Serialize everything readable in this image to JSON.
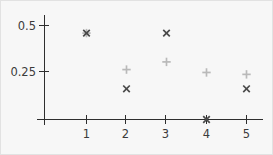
{
  "chart_data": {
    "type": "scatter",
    "title": "",
    "xlabel": "",
    "ylabel": "",
    "x": [
      1,
      2,
      3,
      4,
      5
    ],
    "xlim": [
      0.45,
      5.6
    ],
    "ylim": [
      0,
      0.56
    ],
    "grid": false,
    "legend": "none",
    "xticks": [
      "1",
      "2",
      "3",
      "4",
      "5"
    ],
    "yticks": [
      "0.25",
      "0.5"
    ],
    "ytick_values": [
      0.25,
      0.5
    ],
    "series": [
      {
        "name": "cross-series",
        "marker": "x",
        "color": "#4a4a4a",
        "values": [
          0.45,
          0.16,
          0.45,
          0.0,
          0.16
        ]
      },
      {
        "name": "plus-series",
        "marker": "+",
        "color": "#b9b9b9",
        "values": [
          0.45,
          0.26,
          0.3,
          0.245,
          0.235
        ]
      }
    ]
  },
  "axes": {
    "y_tick_0": "0.5",
    "y_tick_1": "0.25",
    "x_tick_0": "1",
    "x_tick_1": "2",
    "x_tick_2": "3",
    "x_tick_3": "4",
    "x_tick_4": "5"
  }
}
